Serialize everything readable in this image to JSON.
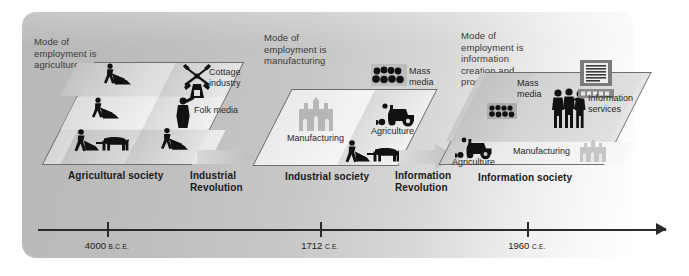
{
  "figure": {
    "type": "timeline-diagram"
  },
  "stages": [
    {
      "id": "agricultural",
      "mode_caption": "Mode of\nemployment is\nagriculture",
      "mode_lines": [
        "Mode of",
        "employment is",
        "agriculture"
      ],
      "society_label": "Agricultural society",
      "inner_labels": [
        {
          "name": "cottage-industry",
          "text_lines": [
            "Cottage",
            "industry"
          ]
        },
        {
          "name": "folk-media",
          "text_lines": [
            "Folk media"
          ]
        }
      ],
      "icons": [
        "farmer-plow",
        "farmer-plow",
        "farmer-ox-plow",
        "farmer-plow",
        "windmill",
        "town-crier-horn"
      ]
    },
    {
      "id": "industrial",
      "mode_caption": "Mode of\nemployment is\nmanufacturing",
      "mode_lines": [
        "Mode of",
        "employment is",
        "manufacturing"
      ],
      "society_label": "Industrial society",
      "inner_labels": [
        {
          "name": "mass-media",
          "text_lines": [
            "Mass",
            "media"
          ]
        },
        {
          "name": "manufacturing",
          "text_lines": [
            "Manufacturing"
          ]
        },
        {
          "name": "agriculture",
          "text_lines": [
            "Agriculture"
          ]
        }
      ],
      "icons": [
        "cinema-audience",
        "factory-building",
        "tractor",
        "farmer-ox-plow"
      ]
    },
    {
      "id": "information",
      "mode_caption": "Mode of\nemployment is\ninformation\ncreation and\nprocessing",
      "mode_lines": [
        "Mode of",
        "employment is",
        "information",
        "creation and",
        "processing"
      ],
      "society_label": "Information society",
      "inner_labels": [
        {
          "name": "mass-media",
          "text_lines": [
            "Mass",
            "media"
          ]
        },
        {
          "name": "information-services",
          "text_lines": [
            "Information",
            "services"
          ]
        },
        {
          "name": "manufacturing",
          "text_lines": [
            "Manufacturing"
          ]
        },
        {
          "name": "agriculture",
          "text_lines": [
            "Agriculture"
          ]
        }
      ],
      "icons": [
        "cinema-audience",
        "office-workers",
        "computer-monitor",
        "factory-building",
        "tractor"
      ]
    }
  ],
  "transitions": [
    {
      "id": "industrial-revolution",
      "lines": [
        "Industrial",
        "Revolution"
      ]
    },
    {
      "id": "information-revolution",
      "lines": [
        "Information",
        "Revolution"
      ]
    }
  ],
  "timeline": {
    "ticks": [
      {
        "year": "4000",
        "era": "B.C.E."
      },
      {
        "year": "1712",
        "era": "C.E."
      },
      {
        "year": "1960",
        "era": "C.E."
      }
    ],
    "direction": "left-to-right"
  },
  "colors": {
    "panel_light": "#f2f2f2",
    "panel_mid": "#d3d3d3",
    "panel_dark": "#b8b8b8",
    "outline": "#6f6f6f",
    "text": "#231f20",
    "axis": "#2a2a2a",
    "arrow_grey": "#c9c9c9"
  }
}
